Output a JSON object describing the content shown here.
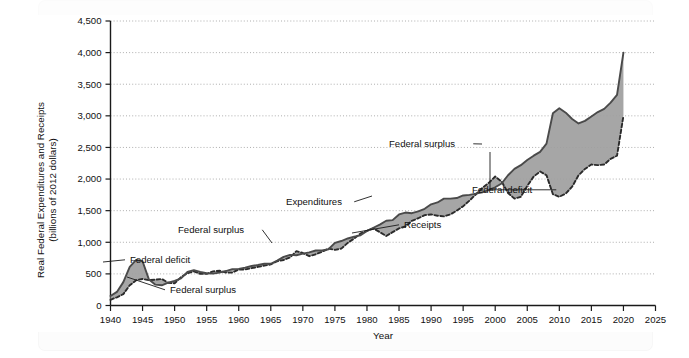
{
  "figure": {
    "background": "#ffffff",
    "band_color": "#9e9e9e",
    "expenditures_color": "#4a4a4a",
    "receipts_color": "#2b2b2b"
  },
  "chart_data": {
    "type": "area",
    "title": "",
    "xlabel": "Year",
    "ylabel": "Real Federal Expenditures and Receipts (billions of 2012 dollars)",
    "ylabel_line1": "Real Federal Expenditures and Receipts",
    "ylabel_line2": "(billions of 2012 dollars)",
    "xlim": [
      1940,
      2025
    ],
    "ylim": [
      0,
      4500
    ],
    "grid": true,
    "legend_position": "none",
    "xticks": [
      1940,
      1945,
      1950,
      1955,
      1960,
      1965,
      1970,
      1975,
      1980,
      1985,
      1990,
      1995,
      2000,
      2005,
      2010,
      2015,
      2020,
      2025
    ],
    "xticklabels": [
      "1940",
      "1945",
      "1950",
      "1955",
      "1960",
      "1965",
      "1970",
      "1975",
      "1980",
      "1985",
      "1990",
      "1995",
      "2000",
      "2005",
      "2010",
      "2015",
      "2020",
      "2025"
    ],
    "yticks": [
      0,
      500,
      1000,
      1500,
      2000,
      2500,
      3000,
      3500,
      4000,
      4500
    ],
    "yticklabels": [
      "0",
      "500",
      "1,000",
      "1,500",
      "2,000",
      "2,500",
      "3,000",
      "3,500",
      "4,000",
      "4,500"
    ],
    "x": [
      1940,
      1941,
      1942,
      1943,
      1944,
      1945,
      1946,
      1947,
      1948,
      1949,
      1950,
      1951,
      1952,
      1953,
      1954,
      1955,
      1956,
      1957,
      1958,
      1959,
      1960,
      1961,
      1962,
      1963,
      1964,
      1965,
      1966,
      1967,
      1968,
      1969,
      1970,
      1971,
      1972,
      1973,
      1974,
      1975,
      1976,
      1977,
      1978,
      1979,
      1980,
      1981,
      1982,
      1983,
      1984,
      1985,
      1986,
      1987,
      1988,
      1989,
      1990,
      1991,
      1992,
      1993,
      1994,
      1995,
      1996,
      1997,
      1998,
      1999,
      2000,
      2001,
      2002,
      2003,
      2004,
      2005,
      2006,
      2007,
      2008,
      2009,
      2010,
      2011,
      2012,
      2013,
      2014,
      2015,
      2016,
      2017,
      2018,
      2019,
      2020
    ],
    "series": [
      {
        "name": "Expenditures",
        "style": "solid",
        "values": [
          150,
          215,
          370,
          610,
          720,
          700,
          410,
          330,
          320,
          360,
          390,
          430,
          530,
          560,
          530,
          510,
          505,
          520,
          545,
          575,
          580,
          600,
          625,
          640,
          660,
          660,
          710,
          770,
          800,
          795,
          820,
          840,
          870,
          870,
          890,
          990,
          1020,
          1060,
          1090,
          1110,
          1180,
          1230,
          1280,
          1340,
          1350,
          1440,
          1470,
          1460,
          1490,
          1530,
          1600,
          1630,
          1690,
          1690,
          1700,
          1740,
          1750,
          1770,
          1790,
          1830,
          1870,
          1930,
          2060,
          2160,
          2220,
          2300,
          2370,
          2430,
          2560,
          3040,
          3120,
          3050,
          2950,
          2880,
          2920,
          2990,
          3060,
          3110,
          3210,
          3330,
          4000
        ],
        "endpoint_value": 4000
      },
      {
        "name": "Receipts",
        "style": "dashed",
        "values": [
          90,
          130,
          180,
          320,
          400,
          420,
          400,
          410,
          420,
          360,
          350,
          450,
          510,
          540,
          500,
          500,
          540,
          550,
          520,
          520,
          570,
          570,
          590,
          610,
          630,
          650,
          700,
          720,
          760,
          860,
          830,
          780,
          810,
          850,
          900,
          880,
          900,
          990,
          1060,
          1140,
          1180,
          1220,
          1160,
          1100,
          1160,
          1220,
          1250,
          1340,
          1380,
          1430,
          1440,
          1420,
          1410,
          1440,
          1500,
          1570,
          1660,
          1760,
          1860,
          1940,
          2040,
          1960,
          1780,
          1690,
          1720,
          1890,
          2040,
          2120,
          2060,
          1760,
          1720,
          1770,
          1880,
          2060,
          2160,
          2230,
          2220,
          2230,
          2320,
          2370,
          3000
        ],
        "endpoint_value": 3000
      }
    ],
    "annotations": [
      {
        "id": "federal-deficit-ww2",
        "label": "Federal deficit",
        "text_x": 130,
        "text_y": 263,
        "target_x": 103,
        "target_y": 262
      },
      {
        "id": "federal-surplus-1950s",
        "label": "Federal surplus",
        "text_x": 170,
        "text_y": 293,
        "target_x": 127,
        "target_y": 277
      },
      {
        "id": "federal-surplus-1970",
        "label": "Federal surplus",
        "text_x": 178,
        "text_y": 233,
        "target_x": 272,
        "target_y": 243
      },
      {
        "id": "expenditures",
        "label": "Expenditures",
        "text_x": 286,
        "text_y": 205,
        "target_x": 372,
        "target_y": 196
      },
      {
        "id": "receipts",
        "label": "Receipts",
        "text_x": 404,
        "text_y": 228,
        "target_x": 352,
        "target_y": 233
      },
      {
        "id": "federal-surplus-2000",
        "label": "Federal surplus",
        "text_x": 389,
        "text_y": 147,
        "target_x": 482,
        "target_y": 144
      },
      {
        "id": "federal-deficit-2002",
        "label": "Federal deficit",
        "text_x": 472,
        "text_y": 193,
        "target_x": 490,
        "target_y": 152
      }
    ]
  }
}
